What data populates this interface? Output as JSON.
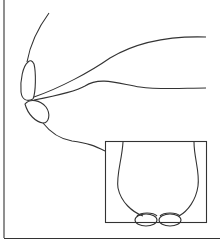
{
  "figure": {
    "type": "line-drawing",
    "colors": {
      "stroke": "#333333",
      "background": "#ffffff"
    },
    "inset": {
      "label": "front-view-inset"
    }
  }
}
